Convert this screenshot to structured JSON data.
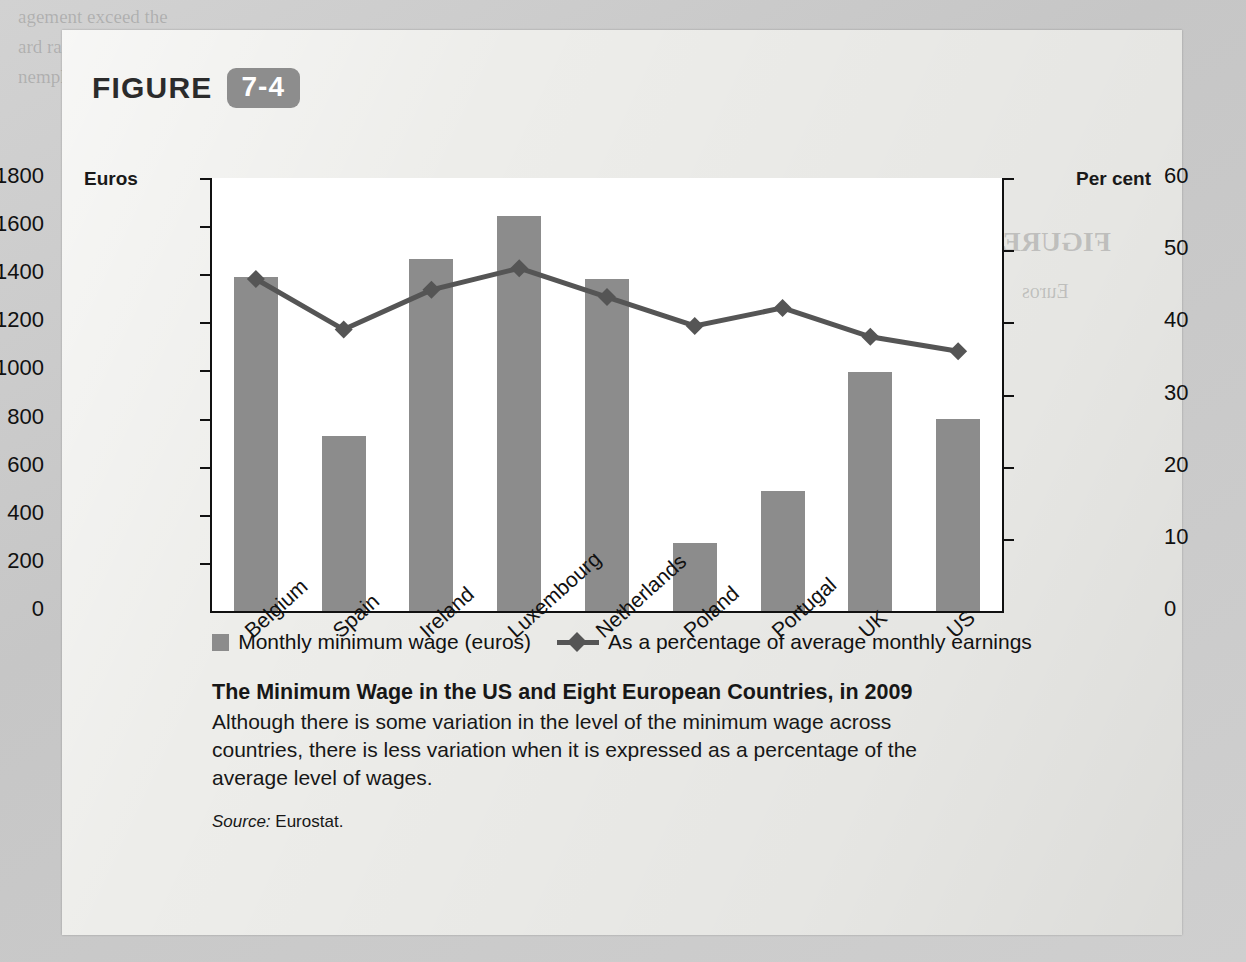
{
  "figure": {
    "word": "FIGURE",
    "number": "7-4"
  },
  "axes": {
    "left_unit": "Euros",
    "right_unit": "Per cent",
    "left_ticks": [
      "1800",
      "1600",
      "1400",
      "1200",
      "1000",
      "800",
      "600",
      "400",
      "200",
      "0"
    ],
    "right_ticks": [
      "60",
      "50",
      "40",
      "30",
      "20",
      "10",
      "0"
    ]
  },
  "legend": {
    "bar_label": "Monthly minimum wage (euros)",
    "line_label": "As a percentage of average monthly earnings"
  },
  "caption": {
    "title": "The Minimum Wage in the US and Eight European Countries, in 2009",
    "body": "Although there is some variation in the level of the minimum wage across countries, there is less variation when it is expressed as a percentage of the average level of wages.",
    "source_label": "Source:",
    "source_value": "Eurostat."
  },
  "colors": {
    "bar": "#8c8c8c",
    "line": "#555555",
    "badge": "#8d8d8d",
    "plot_background": "#ffffff",
    "card_background": "#ededea"
  },
  "chart_data": {
    "type": "bar",
    "title": "The Minimum Wage in the US and Eight European Countries, in 2009",
    "xlabel": "",
    "ylabel": "Euros",
    "y2label": "Per cent",
    "ylim": [
      0,
      1800
    ],
    "y2lim": [
      0,
      60
    ],
    "ytick_step": 200,
    "y2tick_step": 10,
    "grid": false,
    "legend_position": "bottom",
    "categories": [
      "Belgium",
      "Spain",
      "Ireland",
      "Luxembourg",
      "Netherlands",
      "Poland",
      "Portugal",
      "UK",
      "US"
    ],
    "series": [
      {
        "name": "Monthly minimum wage (euros)",
        "type": "bar",
        "axis": "left",
        "values": [
          1387,
          728,
          1462,
          1642,
          1382,
          281,
          500,
          995,
          800
        ]
      },
      {
        "name": "As a percentage of average monthly earnings",
        "type": "line",
        "axis": "right",
        "marker": "diamond",
        "values": [
          46.0,
          39.0,
          44.5,
          47.5,
          43.5,
          39.5,
          42.0,
          38.0,
          36.0
        ]
      }
    ]
  },
  "bleed": {
    "l1": "agement exceed the",
    "l2": "ard raise unemployment",
    "l3": "nemployment",
    "l4": "FIGURE",
    "l5": "Euros",
    "l6": "Per cent"
  }
}
